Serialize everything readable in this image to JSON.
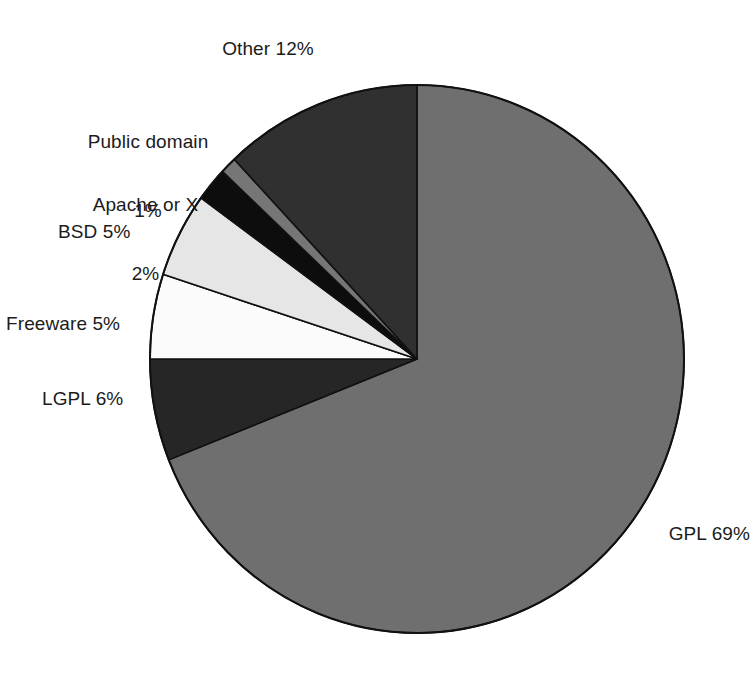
{
  "chart_data": {
    "type": "pie",
    "title": "",
    "subtitle": "",
    "xlabel": "",
    "ylabel": "",
    "grid": false,
    "legend_position": "none",
    "label_format": "{name} {value}%",
    "start_angle_deg": 0,
    "direction": "clockwise",
    "categories": [
      "GPL",
      "LGPL",
      "Freeware",
      "BSD",
      "Apache or X",
      "Public domain",
      "Other"
    ],
    "values": [
      69,
      6,
      5,
      5,
      2,
      1,
      12
    ],
    "unit": "%",
    "total": 100,
    "slices": [
      {
        "name": "GPL",
        "value": 69,
        "value_text": "69%",
        "label": "GPL 69%",
        "color": "#6f6f6f",
        "stroke": "#111111"
      },
      {
        "name": "LGPL",
        "value": 6,
        "value_text": "6%",
        "label": "LGPL 6%",
        "color": "#262626",
        "stroke": "#111111"
      },
      {
        "name": "Freeware",
        "value": 5,
        "value_text": "5%",
        "label": "Freeware 5%",
        "color": "#fbfbfb",
        "stroke": "#111111"
      },
      {
        "name": "BSD",
        "value": 5,
        "value_text": "5%",
        "label": "BSD 5%",
        "color": "#e6e6e6",
        "stroke": "#111111"
      },
      {
        "name": "Apache or X",
        "value": 2,
        "value_text": "2%",
        "label_line1": "Apache or X",
        "label_line2": "2%",
        "label": "Apache or X 2%",
        "color": "#0d0d0d",
        "stroke": "#111111"
      },
      {
        "name": "Public domain",
        "value": 1,
        "value_text": "1%",
        "label_line1": "Public domain",
        "label_line2": "1%",
        "label": "Public domain 1%",
        "color": "#767676",
        "stroke": "#111111"
      },
      {
        "name": "Other",
        "value": 12,
        "value_text": "12%",
        "label": "Other 12%",
        "color": "#303030",
        "stroke": "#111111"
      }
    ]
  },
  "labels": {
    "other": "Other 12%",
    "public_domain_line1": "Public domain",
    "public_domain_line2": "1%",
    "apache_line1": "Apache or X",
    "apache_line2": "2%",
    "bsd": "BSD 5%",
    "freeware": "Freeware 5%",
    "lgpl": "LGPL 6%",
    "gpl": "GPL 69%"
  },
  "geometry": {
    "center_x": 417,
    "center_y": 359,
    "radius_x": 267,
    "radius_y": 274
  },
  "colors": {
    "background": "#ffffff",
    "text": "#1b1b1b",
    "outline": "#111111"
  }
}
